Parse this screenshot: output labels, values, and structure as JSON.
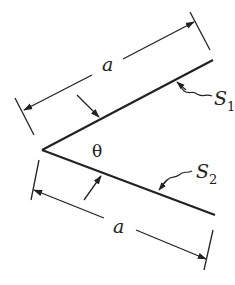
{
  "diagram": {
    "colors": {
      "stroke": "#222222",
      "background": "#ffffff"
    },
    "labels": {
      "length_top": "a",
      "length_bottom": "a",
      "angle": "θ",
      "surface1": "S",
      "surface1_sub": "1",
      "surface2": "S",
      "surface2_sub": "2"
    },
    "elements": [
      {
        "id": "plate-s1",
        "type": "line",
        "from": [
          42,
          150
        ],
        "to": [
          213,
          60
        ]
      },
      {
        "id": "plate-s2",
        "type": "line",
        "from": [
          42,
          150
        ],
        "to": [
          215,
          215
        ]
      },
      {
        "id": "dimension-top",
        "label": "a"
      },
      {
        "id": "dimension-bottom",
        "label": "a"
      },
      {
        "id": "angle-marker",
        "label": "θ"
      }
    ]
  }
}
